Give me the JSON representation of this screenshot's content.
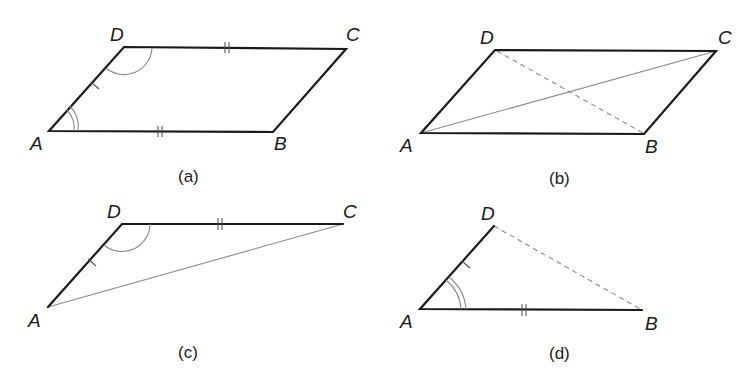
{
  "figure": {
    "panels": [
      {
        "id": "a",
        "caption": "(a)",
        "shape": "parallelogram",
        "vertices": {
          "A": "A",
          "B": "B",
          "C": "C",
          "D": "D"
        },
        "marks": [
          "single tick on AD",
          "double tick on DC",
          "double tick on AB",
          "single arc at D",
          "double arc at A"
        ]
      },
      {
        "id": "b",
        "caption": "(b)",
        "shape": "parallelogram with diagonals",
        "vertices": {
          "A": "A",
          "B": "B",
          "C": "C",
          "D": "D"
        },
        "marks": [
          "solid diagonal AC",
          "dashed diagonal DB"
        ]
      },
      {
        "id": "c",
        "caption": "(c)",
        "shape": "triangle ADC",
        "vertices": {
          "A": "A",
          "C": "C",
          "D": "D"
        },
        "marks": [
          "single tick on AD",
          "double tick on DC",
          "single arc at D"
        ]
      },
      {
        "id": "d",
        "caption": "(d)",
        "shape": "triangle ADB",
        "vertices": {
          "A": "A",
          "B": "B",
          "D": "D"
        },
        "marks": [
          "single tick on AD",
          "double tick on AB",
          "double arc at A",
          "dashed side DB"
        ]
      }
    ]
  }
}
